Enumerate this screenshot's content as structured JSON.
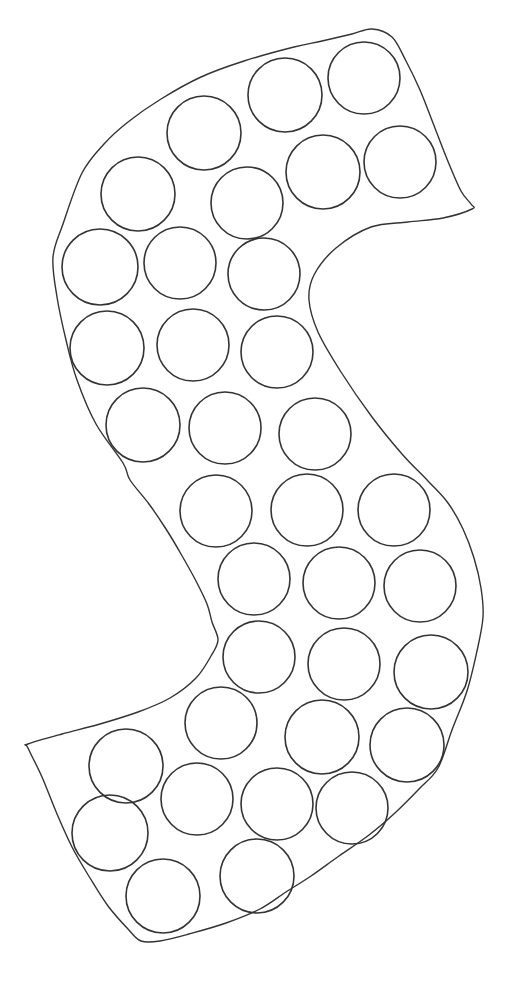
{
  "figure": {
    "letter": "S",
    "background_color": "#ffffff",
    "stroke_color": "#333333",
    "outline_stroke_width": 1.4,
    "circle_stroke_width": 1.6,
    "canvas": {
      "width": 518,
      "height": 992
    },
    "outline_points": [
      [
        372,
        29
      ],
      [
        392,
        37
      ],
      [
        406,
        61
      ],
      [
        420,
        90
      ],
      [
        433,
        123
      ],
      [
        447,
        159
      ],
      [
        461,
        191
      ],
      [
        471,
        204
      ],
      [
        472,
        209
      ],
      [
        443,
        218
      ],
      [
        408,
        222
      ],
      [
        371,
        227
      ],
      [
        336,
        248
      ],
      [
        314,
        275
      ],
      [
        309,
        300
      ],
      [
        318,
        332
      ],
      [
        341,
        372
      ],
      [
        372,
        417
      ],
      [
        402,
        454
      ],
      [
        428,
        481
      ],
      [
        448,
        503
      ],
      [
        463,
        529
      ],
      [
        474,
        558
      ],
      [
        481,
        588
      ],
      [
        483,
        617
      ],
      [
        477,
        651
      ],
      [
        467,
        691
      ],
      [
        452,
        730
      ],
      [
        438,
        768
      ],
      [
        419,
        789
      ],
      [
        396,
        812
      ],
      [
        369,
        835
      ],
      [
        339,
        856
      ],
      [
        311,
        876
      ],
      [
        286,
        892
      ],
      [
        260,
        909
      ],
      [
        226,
        923
      ],
      [
        189,
        934
      ],
      [
        160,
        941
      ],
      [
        141,
        941
      ],
      [
        128,
        929
      ],
      [
        108,
        906
      ],
      [
        90,
        878
      ],
      [
        72,
        847
      ],
      [
        57,
        814
      ],
      [
        42,
        777
      ],
      [
        28,
        748
      ],
      [
        28,
        744
      ],
      [
        62,
        734
      ],
      [
        100,
        724
      ],
      [
        138,
        712
      ],
      [
        170,
        698
      ],
      [
        196,
        678
      ],
      [
        211,
        656
      ],
      [
        218,
        640
      ],
      [
        212,
        622
      ],
      [
        207,
        604
      ],
      [
        196,
        581
      ],
      [
        181,
        554
      ],
      [
        166,
        529
      ],
      [
        149,
        504
      ],
      [
        130,
        480
      ],
      [
        123,
        463
      ],
      [
        96,
        424
      ],
      [
        77,
        380
      ],
      [
        66,
        340
      ],
      [
        57,
        297
      ],
      [
        53,
        257
      ],
      [
        63,
        224
      ],
      [
        82,
        173
      ],
      [
        104,
        144
      ],
      [
        128,
        122
      ],
      [
        161,
        99
      ],
      [
        201,
        77
      ],
      [
        244,
        61
      ],
      [
        294,
        47
      ],
      [
        322,
        41
      ],
      [
        352,
        34
      ]
    ],
    "dot_circles": [
      {
        "cx": 285,
        "cy": 95,
        "r": 37
      },
      {
        "cx": 364,
        "cy": 78,
        "r": 36
      },
      {
        "cx": 204,
        "cy": 133,
        "r": 37
      },
      {
        "cx": 323,
        "cy": 172,
        "r": 37
      },
      {
        "cx": 400,
        "cy": 162,
        "r": 36
      },
      {
        "cx": 138,
        "cy": 194,
        "r": 37
      },
      {
        "cx": 247,
        "cy": 203,
        "r": 36
      },
      {
        "cx": 100,
        "cy": 267,
        "r": 38
      },
      {
        "cx": 180,
        "cy": 263,
        "r": 36
      },
      {
        "cx": 264,
        "cy": 274,
        "r": 36
      },
      {
        "cx": 107,
        "cy": 348,
        "r": 37
      },
      {
        "cx": 193,
        "cy": 345,
        "r": 36
      },
      {
        "cx": 277,
        "cy": 352,
        "r": 36
      },
      {
        "cx": 143,
        "cy": 425,
        "r": 37
      },
      {
        "cx": 225,
        "cy": 428,
        "r": 36
      },
      {
        "cx": 315,
        "cy": 434,
        "r": 36
      },
      {
        "cx": 216,
        "cy": 511,
        "r": 36
      },
      {
        "cx": 307,
        "cy": 510,
        "r": 36
      },
      {
        "cx": 394,
        "cy": 510,
        "r": 36
      },
      {
        "cx": 254,
        "cy": 579,
        "r": 36
      },
      {
        "cx": 339,
        "cy": 583,
        "r": 36
      },
      {
        "cx": 420,
        "cy": 586,
        "r": 36
      },
      {
        "cx": 259,
        "cy": 657,
        "r": 36
      },
      {
        "cx": 344,
        "cy": 664,
        "r": 36
      },
      {
        "cx": 431,
        "cy": 672,
        "r": 37
      },
      {
        "cx": 221,
        "cy": 723,
        "r": 36
      },
      {
        "cx": 322,
        "cy": 737,
        "r": 37
      },
      {
        "cx": 407,
        "cy": 745,
        "r": 37
      },
      {
        "cx": 126,
        "cy": 766,
        "r": 37
      },
      {
        "cx": 197,
        "cy": 799,
        "r": 36
      },
      {
        "cx": 277,
        "cy": 804,
        "r": 36
      },
      {
        "cx": 352,
        "cy": 808,
        "r": 36
      },
      {
        "cx": 110,
        "cy": 833,
        "r": 38
      },
      {
        "cx": 257,
        "cy": 876,
        "r": 37
      },
      {
        "cx": 163,
        "cy": 896,
        "r": 37
      }
    ]
  }
}
